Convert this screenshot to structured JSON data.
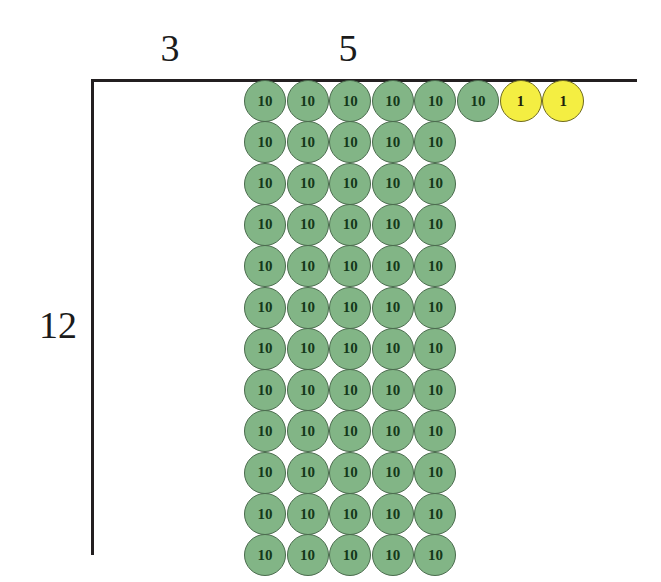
{
  "figure": {
    "type": "base-ten-block-area-model",
    "background_color": "#ffffff"
  },
  "axis": {
    "color": "#231f20",
    "horizontal": {
      "x": 91,
      "y": 79,
      "length": 546,
      "thickness": 3
    },
    "vertical": {
      "x": 91,
      "y": 79,
      "length": 476,
      "thickness": 3
    }
  },
  "labels": [
    {
      "name": "label-3",
      "text": "3",
      "x": 170,
      "y": 48,
      "font_size": 38
    },
    {
      "name": "label-5",
      "text": "5",
      "x": 348,
      "y": 48,
      "font_size": 38
    },
    {
      "name": "label-12",
      "text": "12",
      "x": 58,
      "y": 325,
      "font_size": 38
    }
  ],
  "counters": {
    "ten_label": "10",
    "one_label": "1",
    "ten_color": "#82b586",
    "ten_border_color": "#4a6b4d",
    "one_color": "#f4ee42",
    "one_border_color": "#6f6a1f",
    "diameter": 42,
    "col_step": 42.6,
    "row_step": 41.3,
    "origin_x": 244,
    "origin_y": 80,
    "top_row_ten_count": 6,
    "top_row_one_count": 2,
    "grid_columns": 5,
    "grid_rows": 12,
    "total_tens": 66,
    "total_ones": 2
  },
  "chart_data": {
    "type": "table",
    "title": "",
    "rows": [
      {
        "row": 1,
        "tens": 6,
        "ones": 2,
        "values": [
          "10",
          "10",
          "10",
          "10",
          "10",
          "10",
          "1",
          "1"
        ]
      },
      {
        "row": 2,
        "tens": 5,
        "ones": 0,
        "values": [
          "10",
          "10",
          "10",
          "10",
          "10"
        ]
      },
      {
        "row": 3,
        "tens": 5,
        "ones": 0,
        "values": [
          "10",
          "10",
          "10",
          "10",
          "10"
        ]
      },
      {
        "row": 4,
        "tens": 5,
        "ones": 0,
        "values": [
          "10",
          "10",
          "10",
          "10",
          "10"
        ]
      },
      {
        "row": 5,
        "tens": 5,
        "ones": 0,
        "values": [
          "10",
          "10",
          "10",
          "10",
          "10"
        ]
      },
      {
        "row": 6,
        "tens": 5,
        "ones": 0,
        "values": [
          "10",
          "10",
          "10",
          "10",
          "10"
        ]
      },
      {
        "row": 7,
        "tens": 5,
        "ones": 0,
        "values": [
          "10",
          "10",
          "10",
          "10",
          "10"
        ]
      },
      {
        "row": 8,
        "tens": 5,
        "ones": 0,
        "values": [
          "10",
          "10",
          "10",
          "10",
          "10"
        ]
      },
      {
        "row": 9,
        "tens": 5,
        "ones": 0,
        "values": [
          "10",
          "10",
          "10",
          "10",
          "10"
        ]
      },
      {
        "row": 10,
        "tens": 5,
        "ones": 0,
        "values": [
          "10",
          "10",
          "10",
          "10",
          "10"
        ]
      },
      {
        "row": 11,
        "tens": 5,
        "ones": 0,
        "values": [
          "10",
          "10",
          "10",
          "10",
          "10"
        ]
      },
      {
        "row": 12,
        "tens": 5,
        "ones": 0,
        "values": [
          "10",
          "10",
          "10",
          "10",
          "10"
        ]
      }
    ],
    "dimension_labels": [
      "3",
      "5",
      "12"
    ]
  }
}
